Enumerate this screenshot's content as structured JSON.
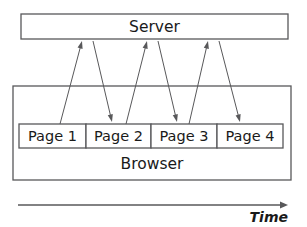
{
  "diagram": {
    "type": "sequence-flow",
    "title_visible": false,
    "server": {
      "label": "Server",
      "box": {
        "x": 21,
        "y": 14,
        "width": 267,
        "height": 25
      }
    },
    "browser": {
      "label": "Browser",
      "box": {
        "x": 13,
        "y": 86,
        "width": 278,
        "height": 94
      },
      "label_position": {
        "x": 152,
        "y": 164
      }
    },
    "pages": [
      {
        "label": "Page 1",
        "box": {
          "x": 19,
          "y": 124,
          "width": 67,
          "height": 24
        }
      },
      {
        "label": "Page 2",
        "box": {
          "x": 86,
          "y": 124,
          "width": 65,
          "height": 24
        }
      },
      {
        "label": "Page 3",
        "box": {
          "x": 151,
          "y": 124,
          "width": 66,
          "height": 24
        }
      },
      {
        "label": "Page 4",
        "box": {
          "x": 217,
          "y": 124,
          "width": 66,
          "height": 24
        }
      }
    ],
    "flows": [
      {
        "name": "page1-request-to-server",
        "direction": "up",
        "from": {
          "x": 60,
          "y": 124
        },
        "to": {
          "x": 82,
          "y": 41
        }
      },
      {
        "name": "server-response-to-page2",
        "direction": "down",
        "from": {
          "x": 93,
          "y": 41
        },
        "to": {
          "x": 112,
          "y": 122
        }
      },
      {
        "name": "page2-request-to-server",
        "direction": "up",
        "from": {
          "x": 126,
          "y": 124
        },
        "to": {
          "x": 147,
          "y": 41
        }
      },
      {
        "name": "server-response-to-page3",
        "direction": "down",
        "from": {
          "x": 158,
          "y": 41
        },
        "to": {
          "x": 177,
          "y": 122
        }
      },
      {
        "name": "page3-request-to-server",
        "direction": "up",
        "from": {
          "x": 189,
          "y": 124
        },
        "to": {
          "x": 208,
          "y": 41
        }
      },
      {
        "name": "server-response-to-page4",
        "direction": "down",
        "from": {
          "x": 219,
          "y": 41
        },
        "to": {
          "x": 240,
          "y": 122
        }
      }
    ],
    "time_axis": {
      "label": "Time",
      "line": {
        "x1": 18,
        "y1": 205,
        "x2": 288,
        "y2": 205
      },
      "label_position": {
        "x": 288,
        "y": 218
      },
      "direction": "left-to-right"
    },
    "colors": {
      "stroke": "#58585a",
      "text": "#1a1a1a",
      "background": "#ffffff",
      "fill": "#ffffff"
    }
  }
}
